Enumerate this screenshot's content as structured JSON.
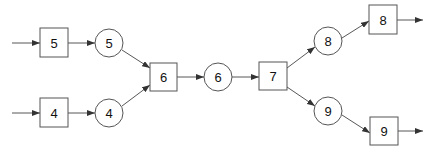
{
  "diagram": {
    "type": "flow-network",
    "boxes": [
      {
        "id": "b5",
        "label": "5"
      },
      {
        "id": "b4",
        "label": "4"
      },
      {
        "id": "b6",
        "label": "6"
      },
      {
        "id": "b7",
        "label": "7"
      },
      {
        "id": "b8",
        "label": "8"
      },
      {
        "id": "b9",
        "label": "9"
      }
    ],
    "circles": [
      {
        "id": "c5",
        "label": "5"
      },
      {
        "id": "c4",
        "label": "4"
      },
      {
        "id": "c6",
        "label": "6"
      },
      {
        "id": "c8",
        "label": "8"
      },
      {
        "id": "c9",
        "label": "9"
      }
    ],
    "edges": [
      [
        "input",
        "b5"
      ],
      [
        "b5",
        "c5"
      ],
      [
        "c5",
        "b6"
      ],
      [
        "input",
        "b4"
      ],
      [
        "b4",
        "c4"
      ],
      [
        "c4",
        "b6"
      ],
      [
        "b6",
        "c6"
      ],
      [
        "c6",
        "b7"
      ],
      [
        "b7",
        "c8"
      ],
      [
        "c8",
        "b8"
      ],
      [
        "b8",
        "output"
      ],
      [
        "b7",
        "c9"
      ],
      [
        "c9",
        "b9"
      ],
      [
        "b9",
        "output"
      ]
    ]
  }
}
